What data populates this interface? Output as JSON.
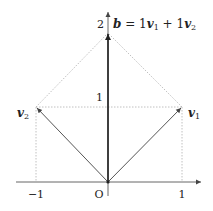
{
  "diagram": {
    "type": "vector-addition",
    "origin_label": "O",
    "x_ticks": [
      {
        "value": -1,
        "label": "−1"
      },
      {
        "value": 1,
        "label": "1"
      }
    ],
    "y_ticks": [
      {
        "value": 1,
        "label": "1"
      },
      {
        "value": 2,
        "label": "2"
      }
    ],
    "vectors": [
      {
        "name": "v1",
        "label_main": "v",
        "label_sub": "1",
        "x": 1,
        "y": 1
      },
      {
        "name": "v2",
        "label_main": "v",
        "label_sub": "2",
        "x": -1,
        "y": 1
      },
      {
        "name": "b",
        "x": 0,
        "y": 2
      }
    ],
    "b_equation": {
      "lhs": "b",
      "eq": " = 1",
      "v1_main": "v",
      "v1_sub": "1",
      "plus": " + 1",
      "v2_main": "v",
      "v2_sub": "2"
    },
    "colors": {
      "axis": "#555555",
      "vector": "#555555",
      "b_vector": "#222222",
      "dotted": "#aaaaaa"
    }
  }
}
